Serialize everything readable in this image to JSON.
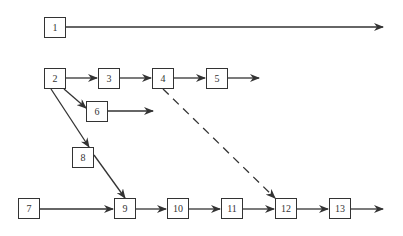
{
  "diagram": {
    "type": "directed-graph",
    "nodes": [
      {
        "id": "1",
        "label": "1",
        "x": 44,
        "y": 17
      },
      {
        "id": "2",
        "label": "2",
        "x": 44,
        "y": 68
      },
      {
        "id": "3",
        "label": "3",
        "x": 98,
        "y": 68
      },
      {
        "id": "4",
        "label": "4",
        "x": 152,
        "y": 68
      },
      {
        "id": "5",
        "label": "5",
        "x": 206,
        "y": 68
      },
      {
        "id": "6",
        "label": "6",
        "x": 86,
        "y": 101
      },
      {
        "id": "7",
        "label": "7",
        "x": 18,
        "y": 198
      },
      {
        "id": "8",
        "label": "8",
        "x": 72,
        "y": 147
      },
      {
        "id": "9",
        "label": "9",
        "x": 114,
        "y": 198
      },
      {
        "id": "10",
        "label": "10",
        "x": 167,
        "y": 198
      },
      {
        "id": "11",
        "label": "11",
        "x": 221,
        "y": 198
      },
      {
        "id": "12",
        "label": "12",
        "x": 275,
        "y": 198
      },
      {
        "id": "13",
        "label": "13",
        "x": 329,
        "y": 198
      }
    ],
    "edges": [
      {
        "from": "1",
        "to": null,
        "style": "solid"
      },
      {
        "from": "2",
        "to": "3",
        "style": "solid"
      },
      {
        "from": "3",
        "to": "4",
        "style": "solid"
      },
      {
        "from": "4",
        "to": "5",
        "style": "solid"
      },
      {
        "from": "5",
        "to": null,
        "style": "solid"
      },
      {
        "from": "2",
        "to": "6",
        "style": "solid"
      },
      {
        "from": "6",
        "to": null,
        "style": "solid"
      },
      {
        "from": "2",
        "to": "8",
        "style": "solid"
      },
      {
        "from": "8",
        "to": "9",
        "style": "solid"
      },
      {
        "from": "7",
        "to": "9",
        "style": "solid"
      },
      {
        "from": "9",
        "to": "10",
        "style": "solid"
      },
      {
        "from": "10",
        "to": "11",
        "style": "solid"
      },
      {
        "from": "11",
        "to": "12",
        "style": "solid"
      },
      {
        "from": "12",
        "to": "13",
        "style": "solid"
      },
      {
        "from": "13",
        "to": null,
        "style": "solid"
      },
      {
        "from": "4",
        "to": "12",
        "style": "dashed"
      }
    ],
    "colors": {
      "stroke": "#333333",
      "background": "#ffffff"
    }
  }
}
